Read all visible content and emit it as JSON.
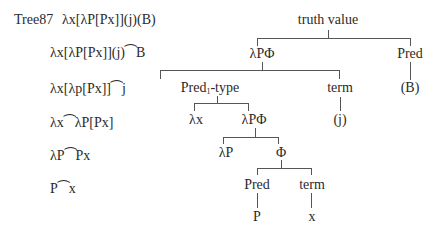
{
  "title": "Tree87",
  "derivation": [
    "λx[λP[Px]](j)(B)",
    "λx[λP[Px]](j)⁀B",
    "λx[λp[Px]]⁀j",
    "λx⁀λP[Px]",
    "λP⁀Px",
    "P⁀x"
  ],
  "tree": {
    "root": "truth value",
    "l1_left": "λPΦ",
    "l1_right": "Pred",
    "l2_left_base": "Pred",
    "l2_left_sub": "1",
    "l2_left_suffix": "-type",
    "l2_mid": "term",
    "l2_right": "(B)",
    "l3_lx": "λx",
    "l3_lpf": "λPΦ",
    "l3_j": "(j)",
    "l4_lp": "λP",
    "l4_phi": "Φ",
    "l5_pred": "Pred",
    "l5_term": "term",
    "l6_p": "P",
    "l6_x": "x"
  }
}
